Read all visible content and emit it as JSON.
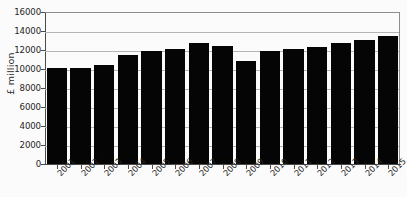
{
  "chart_data": {
    "type": "bar",
    "title": "",
    "subtitle": "",
    "xlabel": "",
    "ylabel": "£ million",
    "ylim": [
      0,
      16000
    ],
    "yticks": [
      0,
      2000,
      4000,
      6000,
      8000,
      10000,
      12000,
      14000,
      16000
    ],
    "ytick_labels": [
      "0",
      "2000",
      "4000",
      "6000",
      "8000",
      "10000",
      "12000",
      "14000",
      "16000"
    ],
    "grid": true,
    "legend": null,
    "bar_color": "#050505",
    "categories": [
      "2001",
      "2002",
      "2003",
      "2004",
      "2005",
      "2006",
      "2007",
      "2008",
      "2009",
      "2010",
      "2011",
      "2012",
      "2013",
      "2014",
      "2015"
    ],
    "values": [
      10100,
      10100,
      10400,
      11500,
      11900,
      12100,
      12700,
      12400,
      10800,
      11900,
      12100,
      12300,
      12700,
      13100,
      13500
    ]
  },
  "colors": {
    "background": "#fbfbfb",
    "axis": "#4a4a4a",
    "gridline": "#b4b4b4",
    "frame": "#8e8e8e",
    "text": "#242424",
    "bar": "#050505"
  }
}
